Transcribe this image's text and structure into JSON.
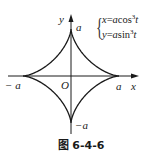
{
  "figure": {
    "caption": "图 6-4-6",
    "curve_name": "astroid",
    "equations": {
      "x_lhs": "x",
      "x_rhs_coef": "a",
      "x_rhs_func": "cos",
      "x_rhs_power": "3",
      "x_rhs_var": "t",
      "y_lhs": "y",
      "y_rhs_coef": "a",
      "y_rhs_func": "sin",
      "y_rhs_power": "3",
      "y_rhs_var": "t",
      "equals": "="
    },
    "axes": {
      "x_label": "x",
      "y_label": "y",
      "origin_label": "O"
    },
    "ticks": {
      "pos_x": "a",
      "neg_x": "− a",
      "pos_y": "a",
      "neg_y": "−a"
    },
    "colors": {
      "stroke": "#1a1a1a",
      "background": "#ffffff"
    }
  }
}
